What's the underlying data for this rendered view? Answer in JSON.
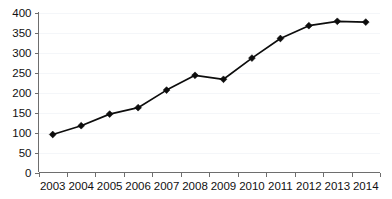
{
  "chart_data": {
    "type": "line",
    "title": "",
    "subtitle": "",
    "xlabel": "",
    "ylabel": "",
    "categories": [
      "2003",
      "2004",
      "2005",
      "2006",
      "2007",
      "2008",
      "2009",
      "2010",
      "2011",
      "2012",
      "2013",
      "2014"
    ],
    "values": [
      95,
      117,
      146,
      162,
      206,
      243,
      233,
      286,
      335,
      367,
      378,
      376
    ],
    "series": [
      {
        "name": "",
        "values": [
          95,
          117,
          146,
          162,
          206,
          243,
          233,
          286,
          335,
          367,
          378,
          376
        ]
      }
    ],
    "ylim": [
      0,
      400
    ],
    "y_ticks": [
      0,
      50,
      100,
      150,
      200,
      250,
      300,
      350,
      400
    ],
    "y_tick_labels": [
      "0",
      "50",
      "100",
      "150",
      "200",
      "250",
      "300",
      "350",
      "400"
    ],
    "x_tick_labels": [
      "2003",
      "2004",
      "2005",
      "2006",
      "2007",
      "2008",
      "2009",
      "2010",
      "2011",
      "2012",
      "2013",
      "2014"
    ],
    "grid": "horizontal",
    "legend": "none",
    "marker": "diamond",
    "colors": {
      "line": "#0d0d0d",
      "marker": "#0d0d0d",
      "grid": "#f4f6f9",
      "axis": "#6e6e6e",
      "text": "#111111",
      "background": "#ffffff"
    }
  }
}
